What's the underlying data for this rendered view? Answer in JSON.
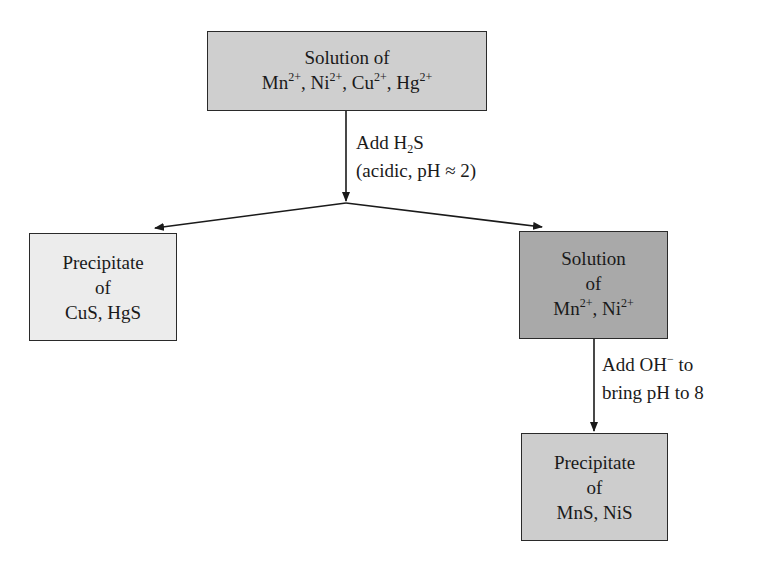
{
  "diagram": {
    "type": "flowchart",
    "colors": {
      "top_box_fill": "#cfcfcf",
      "left_box_fill": "#ececec",
      "right_solution_fill": "#a9a9a9",
      "bottom_box_fill": "#cdcdcd",
      "border": "#2a2a2a",
      "arrow": "#1a1a1a"
    },
    "nodes": {
      "start": {
        "line1": "Solution of",
        "ions": [
          {
            "symbol": "Mn",
            "charge": "2+",
            "sep": ", "
          },
          {
            "symbol": "Ni",
            "charge": "2+",
            "sep": ", "
          },
          {
            "symbol": "Cu",
            "charge": "2+",
            "sep": ", "
          },
          {
            "symbol": "Hg",
            "charge": "2+",
            "sep": ""
          }
        ]
      },
      "precipitate_1": {
        "line1": "Precipitate",
        "line2": "of",
        "line3": "CuS, HgS"
      },
      "solution_2": {
        "line1": "Solution",
        "line2": "of",
        "ions": [
          {
            "symbol": "Mn",
            "charge": "2+",
            "sep": ", "
          },
          {
            "symbol": "Ni",
            "charge": "2+",
            "sep": ""
          }
        ]
      },
      "precipitate_2": {
        "line1": "Precipitate",
        "line2": "of",
        "line3": "MnS, NiS"
      }
    },
    "edges": {
      "step1": {
        "line1_prefix": "Add H",
        "line1_sub": "2",
        "line1_suffix": "S",
        "line2": "(acidic, pH ≈ 2)"
      },
      "step2": {
        "line1_prefix": "Add OH",
        "line1_sup": "−",
        "line1_suffix": " to",
        "line2": "bring pH to 8"
      }
    }
  }
}
